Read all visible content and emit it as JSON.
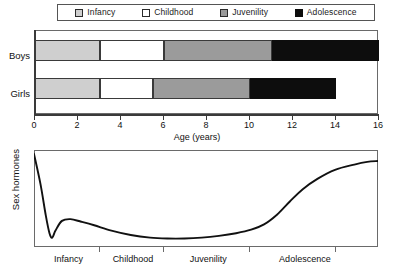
{
  "legend": {
    "items": [
      {
        "label": "Infancy",
        "color": "#cfcfcf",
        "swatch": "legend-swatch-infancy"
      },
      {
        "label": "Childhood",
        "color": "#ffffff",
        "swatch": "legend-swatch-childhood"
      },
      {
        "label": "Juvenility",
        "color": "#9b9b9b",
        "swatch": "legend-swatch-juvenility"
      },
      {
        "label": "Adolescence",
        "color": "#0d0d0d",
        "swatch": "legend-swatch-adolescence"
      }
    ]
  },
  "chart_data": [
    {
      "type": "bar",
      "orientation": "horizontal",
      "stacked": true,
      "title": "",
      "xlabel": "Age (years)",
      "ylabel": "",
      "xlim": [
        0,
        16
      ],
      "xticks": [
        0,
        2,
        4,
        6,
        8,
        10,
        12,
        14,
        16
      ],
      "xticklabels": [
        "0",
        "2",
        "4",
        "6",
        "8",
        "10",
        "12",
        "14",
        "16"
      ],
      "grid": false,
      "legend_position": "top",
      "categories": [
        "Boys",
        "Girls"
      ],
      "series": [
        {
          "name": "Infancy",
          "color": "#cfcfcf",
          "starts": [
            0,
            0
          ],
          "ends": [
            3,
            3
          ],
          "values": [
            3,
            3
          ]
        },
        {
          "name": "Childhood",
          "color": "#ffffff",
          "starts": [
            3,
            3
          ],
          "ends": [
            6,
            5.5
          ],
          "values": [
            3,
            2.5
          ]
        },
        {
          "name": "Juvenility",
          "color": "#9b9b9b",
          "starts": [
            6,
            5.5
          ],
          "ends": [
            11,
            10
          ],
          "values": [
            5,
            4.5
          ]
        },
        {
          "name": "Adolescence",
          "color": "#0d0d0d",
          "starts": [
            11,
            10
          ],
          "ends": [
            16,
            14
          ],
          "values": [
            5,
            4
          ]
        }
      ]
    },
    {
      "type": "line",
      "title": "",
      "xlabel": "",
      "ylabel": "Sex hormones",
      "xlim": [
        0,
        16
      ],
      "ylim": [
        0,
        1
      ],
      "grid": false,
      "legend_position": "none",
      "stage_ticks": [
        3,
        6,
        10,
        14
      ],
      "annotations": [
        {
          "label": "Infancy",
          "x": 1.6
        },
        {
          "label": "Childhood",
          "x": 4.6
        },
        {
          "label": "Juvenility",
          "x": 8.1
        },
        {
          "label": "Adolescence",
          "x": 12.6
        }
      ],
      "series": [
        {
          "name": "Sex hormones",
          "color": "#111111",
          "x": [
            0.0,
            0.3,
            0.55,
            0.72,
            0.85,
            1.0,
            1.3,
            1.7,
            2.2,
            2.8,
            3.6,
            4.5,
            5.4,
            6.2,
            7.0,
            7.8,
            8.6,
            9.4,
            10.1,
            10.7,
            11.3,
            11.9,
            12.5,
            13.2,
            14.0,
            14.9,
            15.5,
            16.0
          ],
          "y": [
            1.0,
            0.66,
            0.3,
            0.1,
            0.05,
            0.13,
            0.24,
            0.26,
            0.23,
            0.19,
            0.13,
            0.08,
            0.05,
            0.04,
            0.04,
            0.05,
            0.07,
            0.1,
            0.14,
            0.2,
            0.31,
            0.46,
            0.6,
            0.72,
            0.82,
            0.88,
            0.91,
            0.92
          ]
        }
      ]
    }
  ]
}
